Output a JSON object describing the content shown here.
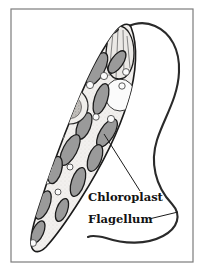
{
  "figure": {
    "kind": "biology-diagram",
    "background_color": "#ffffff",
    "frame": {
      "name": "border-frame",
      "color": "#7c7c7c",
      "x": 11,
      "y": 9,
      "width": 182,
      "height": 253
    }
  },
  "labels": [
    {
      "id": "chloroplast",
      "text": "Chloroplast",
      "x": 88,
      "y": 201,
      "font_size": 11.5,
      "color": "#131313"
    },
    {
      "id": "flagellum",
      "text": "Flagellum",
      "x": 88,
      "y": 223,
      "font_size": 11.5,
      "color": "#131313"
    }
  ],
  "leader_lines": [
    {
      "id": "chloroplast-leader",
      "from_x": 140,
      "from_y": 191,
      "to_x": 104,
      "to_y": 134,
      "color": "#1b1b1b"
    },
    {
      "id": "flagellum-leader",
      "from_x": 149,
      "from_y": 219,
      "to_x": 178,
      "to_y": 212,
      "color": "#1b1b1b"
    }
  ],
  "colors": {
    "outline": "#1b1b1b",
    "cytoplasm": "#f2f0ee",
    "chloroplast_fill": "#9a9a9a",
    "chloroplast_stroke": "#1b1b1b",
    "vesicle_fill": "#fbfbfb",
    "nucleus_fill": "#eceae7",
    "nucleolus_fill": "#bdbab6",
    "eyespot_fill": "#1e1e1e",
    "reservoir_fill": "#ebe9e6",
    "flagellum_stroke": "#2a2a2a",
    "frame_stroke": "#7c7c7c"
  },
  "structures": {
    "cell_body": {
      "name": "euglena-cell-body",
      "path": "M 131 27 C 138 45 137 72 128 101 C 119 131 101 167 80 200 C 68 219 56 236 46 247 C 40 253 34 253 32 248 C 29 241 32 228 38 210 C 48 178 62 140 76 106 C 90 72 105 44 116 31 C 122 24 128 22 131 27 Z"
    },
    "reservoir": {
      "name": "reservoir-gullet",
      "path": "M 119 26 C 127 26 134 37 134 53 C 134 68 128 79 119 79 C 110 79 105 68 106 53 C 107 37 112 26 119 26 Z"
    },
    "eyespot": {
      "name": "eyespot",
      "cx": 114,
      "cy": 31,
      "rx": 5.5,
      "ry": 2.6,
      "rotate": -28
    },
    "nucleus": {
      "name": "nucleus",
      "cx": 70,
      "cy": 106,
      "r": 18
    },
    "nucleolus": {
      "name": "nucleolus",
      "cx": 70,
      "cy": 107,
      "r": 11.5
    },
    "large_vacuole": {
      "name": "contractile-vacuole",
      "cx": 120,
      "cy": 95,
      "rx": 15,
      "ry": 16
    },
    "lower_vacuole": {
      "name": "lower-vacuole",
      "cx": 47,
      "cy": 174,
      "rx": 11,
      "ry": 10
    },
    "chloroplasts": [
      {
        "cx": 97,
        "cy": 69,
        "rx": 18,
        "ry": 7.5,
        "rot": -62
      },
      {
        "cx": 117,
        "cy": 62,
        "rx": 13,
        "ry": 6,
        "rot": -55
      },
      {
        "cx": 75,
        "cy": 84,
        "rx": 15,
        "ry": 6.5,
        "rot": -48
      },
      {
        "cx": 101,
        "cy": 99,
        "rx": 16,
        "ry": 6.5,
        "rot": -72
      },
      {
        "cx": 49,
        "cy": 126,
        "rx": 16,
        "ry": 7,
        "rot": -70
      },
      {
        "cx": 84,
        "cy": 126,
        "rx": 14,
        "ry": 6.5,
        "rot": -68
      },
      {
        "cx": 107,
        "cy": 133,
        "rx": 16,
        "ry": 7,
        "rot": -58
      },
      {
        "cx": 70,
        "cy": 150,
        "rx": 17,
        "ry": 7,
        "rot": -62
      },
      {
        "cx": 95,
        "cy": 158,
        "rx": 14,
        "ry": 6.5,
        "rot": -70
      },
      {
        "cx": 55,
        "cy": 170,
        "rx": 14,
        "ry": 6.5,
        "rot": -74
      },
      {
        "cx": 78,
        "cy": 182,
        "rx": 15,
        "ry": 6.5,
        "rot": -72
      },
      {
        "cx": 43,
        "cy": 205,
        "rx": 15,
        "ry": 6.5,
        "rot": -68
      },
      {
        "cx": 62,
        "cy": 210,
        "rx": 12,
        "ry": 5.5,
        "rot": -70
      },
      {
        "cx": 38,
        "cy": 232,
        "rx": 12,
        "ry": 5.5,
        "rot": -66
      }
    ],
    "vesicles": [
      {
        "cx": 45,
        "cy": 150,
        "r": 4
      },
      {
        "cx": 61,
        "cy": 136,
        "r": 3.2
      },
      {
        "cx": 96,
        "cy": 117,
        "r": 3.2
      },
      {
        "cx": 111,
        "cy": 119,
        "r": 3.6
      },
      {
        "cx": 48,
        "cy": 99,
        "r": 4.2
      },
      {
        "cx": 90,
        "cy": 85,
        "r": 3.6
      },
      {
        "cx": 104,
        "cy": 76,
        "r": 3.6
      },
      {
        "cx": 126,
        "cy": 72,
        "r": 3.4
      },
      {
        "cx": 100,
        "cy": 46,
        "r": 3.6
      },
      {
        "cx": 122,
        "cy": 86,
        "r": 3.2
      },
      {
        "cx": 33,
        "cy": 243,
        "r": 3.4
      },
      {
        "cx": 70,
        "cy": 167,
        "r": 3.0
      },
      {
        "cx": 58,
        "cy": 192,
        "r": 3.0
      }
    ],
    "flagellum": {
      "name": "flagellum",
      "path": "M 119 34 C 126 24 142 20 155 26 C 171 33 180 50 179 72 C 178 98 164 118 157 140 C 150 162 155 186 172 204 C 182 215 178 228 163 236 C 146 245 124 244 106 238 C 98 236 92 235 88 237"
    }
  }
}
